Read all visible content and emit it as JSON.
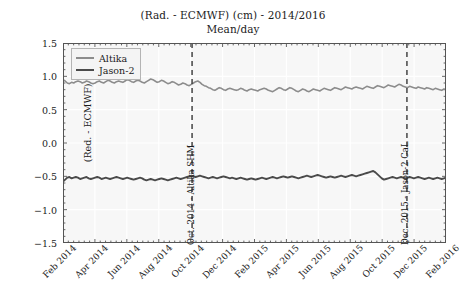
{
  "chart_data": {
    "type": "line",
    "title": "(Rad. - ECMWF) (cm) - 2014/2016",
    "subtitle": "Mean/day",
    "xlabel": "",
    "ylabel": "(Red. - ECMWF) (cm)",
    "ylim": [
      -1.5,
      1.5
    ],
    "yticks": [
      1.5,
      1.0,
      0.5,
      0.0,
      -0.5,
      -1.0,
      -1.5
    ],
    "ytick_labels": [
      "1.5",
      "1.0",
      "0.5",
      "0.0",
      "−0.5",
      "−1.0",
      "−1.5"
    ],
    "xtick_labels": [
      "Feb 2014",
      "Apr 2014",
      "Jun 2014",
      "Aug 2014",
      "Oct 2014",
      "Dec 2014",
      "Feb 2015",
      "Apr 2015",
      "Jun 2015",
      "Aug 2015",
      "Oct 2015",
      "Dec 2015",
      "Feb 2016"
    ],
    "xlim": [
      "Feb 2014",
      "Feb 2016"
    ],
    "grid": true,
    "legend_position": "upper left",
    "colors": {
      "altika": "#8c8c8c",
      "jason2": "#4a4a4a",
      "annotation_line": "#3a3a3a",
      "plot_background": "#f7f7f7",
      "grid": "#ffffff",
      "axis": "#555555"
    },
    "series": [
      {
        "name": "Altika",
        "color": "#8c8c8c",
        "values": [
          0.95,
          0.93,
          0.9,
          0.89,
          0.91,
          0.9,
          0.92,
          0.93,
          0.92,
          0.9,
          0.91,
          0.93,
          0.92,
          0.9,
          0.89,
          0.9,
          0.92,
          0.93,
          0.91,
          0.9,
          0.92,
          0.94,
          0.93,
          0.91,
          0.9,
          0.92,
          0.93,
          0.92,
          0.91,
          0.93,
          0.95,
          0.94,
          0.92,
          0.91,
          0.93,
          0.94,
          0.93,
          0.91,
          0.9,
          0.92,
          0.94,
          0.96,
          0.95,
          0.93,
          0.91,
          0.92,
          0.94,
          0.93,
          0.91,
          0.89,
          0.9,
          0.92,
          0.91,
          0.89,
          0.87,
          0.88,
          0.9,
          0.89,
          0.87,
          0.86,
          0.88,
          0.9,
          0.92,
          0.93,
          0.91,
          0.88,
          0.86,
          0.85,
          0.83,
          0.82,
          0.8,
          0.79,
          0.81,
          0.83,
          0.82,
          0.8,
          0.79,
          0.81,
          0.82,
          0.81,
          0.8,
          0.79,
          0.8,
          0.82,
          0.81,
          0.79,
          0.78,
          0.8,
          0.81,
          0.8,
          0.79,
          0.78,
          0.8,
          0.81,
          0.82,
          0.81,
          0.79,
          0.78,
          0.77,
          0.79,
          0.81,
          0.83,
          0.82,
          0.8,
          0.79,
          0.81,
          0.83,
          0.82,
          0.8,
          0.78,
          0.77,
          0.79,
          0.81,
          0.8,
          0.78,
          0.77,
          0.79,
          0.81,
          0.8,
          0.79,
          0.78,
          0.8,
          0.82,
          0.81,
          0.8,
          0.79,
          0.81,
          0.83,
          0.82,
          0.81,
          0.8,
          0.82,
          0.84,
          0.83,
          0.82,
          0.81,
          0.83,
          0.84,
          0.83,
          0.82,
          0.81,
          0.83,
          0.85,
          0.84,
          0.83,
          0.82,
          0.84,
          0.86,
          0.85,
          0.84,
          0.83,
          0.85,
          0.87,
          0.86,
          0.85,
          0.84,
          0.86,
          0.88,
          0.87,
          0.85,
          0.84,
          0.83,
          0.85,
          0.84,
          0.83,
          0.82,
          0.84,
          0.83,
          0.82,
          0.81,
          0.83,
          0.82,
          0.81,
          0.8,
          0.82,
          0.81,
          0.8,
          0.79,
          0.81,
          0.8
        ]
      },
      {
        "name": "Jason-2",
        "color": "#4a4a4a",
        "values": [
          -0.58,
          -0.55,
          -0.52,
          -0.51,
          -0.53,
          -0.52,
          -0.51,
          -0.52,
          -0.54,
          -0.53,
          -0.52,
          -0.51,
          -0.53,
          -0.54,
          -0.53,
          -0.52,
          -0.51,
          -0.52,
          -0.54,
          -0.53,
          -0.52,
          -0.53,
          -0.54,
          -0.53,
          -0.52,
          -0.51,
          -0.52,
          -0.53,
          -0.54,
          -0.53,
          -0.52,
          -0.53,
          -0.54,
          -0.55,
          -0.54,
          -0.53,
          -0.52,
          -0.53,
          -0.55,
          -0.56,
          -0.55,
          -0.54,
          -0.55,
          -0.56,
          -0.55,
          -0.54,
          -0.53,
          -0.54,
          -0.55,
          -0.56,
          -0.55,
          -0.54,
          -0.53,
          -0.52,
          -0.53,
          -0.54,
          -0.53,
          -0.52,
          -0.51,
          -0.5,
          -0.49,
          -0.5,
          -0.51,
          -0.5,
          -0.49,
          -0.5,
          -0.51,
          -0.52,
          -0.53,
          -0.52,
          -0.51,
          -0.52,
          -0.53,
          -0.52,
          -0.51,
          -0.5,
          -0.51,
          -0.52,
          -0.53,
          -0.52,
          -0.53,
          -0.54,
          -0.53,
          -0.52,
          -0.53,
          -0.54,
          -0.55,
          -0.54,
          -0.53,
          -0.54,
          -0.55,
          -0.54,
          -0.53,
          -0.52,
          -0.53,
          -0.54,
          -0.53,
          -0.52,
          -0.51,
          -0.52,
          -0.53,
          -0.52,
          -0.51,
          -0.5,
          -0.51,
          -0.52,
          -0.51,
          -0.5,
          -0.51,
          -0.52,
          -0.53,
          -0.52,
          -0.51,
          -0.5,
          -0.49,
          -0.5,
          -0.51,
          -0.5,
          -0.49,
          -0.48,
          -0.49,
          -0.5,
          -0.51,
          -0.52,
          -0.51,
          -0.5,
          -0.51,
          -0.52,
          -0.51,
          -0.5,
          -0.49,
          -0.5,
          -0.51,
          -0.5,
          -0.49,
          -0.48,
          -0.49,
          -0.5,
          -0.49,
          -0.48,
          -0.47,
          -0.46,
          -0.45,
          -0.44,
          -0.43,
          -0.42,
          -0.44,
          -0.47,
          -0.5,
          -0.53,
          -0.55,
          -0.54,
          -0.53,
          -0.52,
          -0.51,
          -0.52,
          -0.53,
          -0.52,
          -0.51,
          -0.52,
          -0.53,
          -0.52,
          -0.51,
          -0.52,
          -0.53,
          -0.52,
          -0.51,
          -0.52,
          -0.53,
          -0.54,
          -0.53,
          -0.52,
          -0.53,
          -0.54,
          -0.53,
          -0.52,
          -0.53,
          -0.54,
          -0.53,
          -0.52
        ]
      }
    ],
    "annotations": [
      {
        "label": "Oct. 2014 - Altika SHM",
        "x_fraction": 0.337,
        "style": "dashed-vertical"
      },
      {
        "label": "Dec. 2015 - Jason-2 CaL",
        "x_fraction": 0.898,
        "style": "dashed-vertical"
      }
    ]
  }
}
